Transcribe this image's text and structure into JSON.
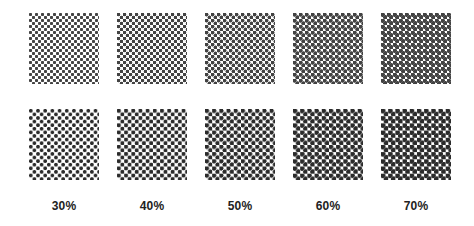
{
  "columns": [
    {
      "label": "30%",
      "coverage": 30
    },
    {
      "label": "40%",
      "coverage": 40
    },
    {
      "label": "50%",
      "coverage": 50
    },
    {
      "label": "60%",
      "coverage": 60
    },
    {
      "label": "70%",
      "coverage": 70
    }
  ],
  "rows": [
    {
      "name": "fine-screen",
      "cell_px": 3.0
    },
    {
      "name": "coarse-screen",
      "cell_px": 3.6
    }
  ],
  "colors": {
    "background": "#ffffff",
    "ink": "#1a1a1a",
    "label": "#222222"
  }
}
